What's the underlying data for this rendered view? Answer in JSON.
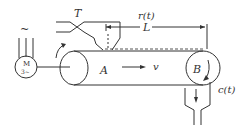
{
  "diagram": {
    "type": "conveyor-belt-transport-delay",
    "labels": {
      "hopper": "T",
      "input_signal": "r(t)",
      "length": "L",
      "point_a": "A",
      "velocity": "v",
      "point_b": "B",
      "output_signal": "c(t)",
      "motor_letter": "M",
      "motor_phase": "3~",
      "ac_symbol": "~"
    },
    "colors": {
      "line": "#333333",
      "background": "#ffffff"
    }
  }
}
